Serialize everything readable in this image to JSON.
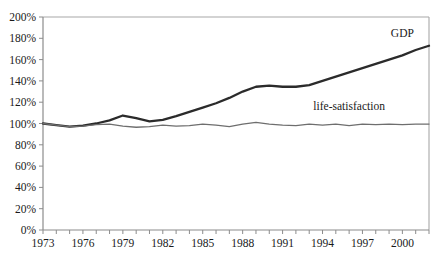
{
  "chart_data": {
    "type": "line",
    "title": "",
    "xlabel": "",
    "ylabel": "",
    "xlim": [
      1973,
      2002
    ],
    "ylim": [
      0,
      200
    ],
    "grid": false,
    "legend": "inline-labels",
    "y_tick_labels": [
      "0%",
      "20%",
      "40%",
      "60%",
      "80%",
      "100%",
      "120%",
      "140%",
      "160%",
      "180%",
      "200%"
    ],
    "y_tick_values": [
      0,
      20,
      40,
      60,
      80,
      100,
      120,
      140,
      160,
      180,
      200
    ],
    "x_tick_labels": [
      "1973",
      "1976",
      "1979",
      "1982",
      "1985",
      "1988",
      "1991",
      "1994",
      "1997",
      "2000"
    ],
    "x_tick_values": [
      1973,
      1976,
      1979,
      1982,
      1985,
      1988,
      1991,
      1994,
      1997,
      2000
    ],
    "x_minor_ticks": [
      1973,
      1974,
      1975,
      1976,
      1977,
      1978,
      1979,
      1980,
      1981,
      1982,
      1983,
      1984,
      1985,
      1986,
      1987,
      1988,
      1989,
      1990,
      1991,
      1992,
      1993,
      1994,
      1995,
      1996,
      1997,
      1998,
      1999,
      2000,
      2001,
      2002
    ],
    "x": [
      1973,
      1974,
      1975,
      1976,
      1977,
      1978,
      1979,
      1980,
      1981,
      1982,
      1983,
      1984,
      1985,
      1986,
      1987,
      1988,
      1989,
      1990,
      1991,
      1992,
      1993,
      1994,
      1995,
      1996,
      1997,
      1998,
      1999,
      2000,
      2001,
      2002
    ],
    "series": [
      {
        "name": "GDP",
        "color": "#2b2b2b",
        "width": 2.3,
        "label_x": 2000,
        "label_y": 181,
        "values": [
          100,
          98.5,
          97,
          98,
          100,
          103,
          107.5,
          105,
          102,
          103.5,
          107,
          111,
          115,
          119,
          124,
          130,
          134.5,
          135.5,
          134.5,
          134.5,
          136,
          140,
          144,
          148,
          152,
          156,
          160,
          164,
          169,
          173
        ]
      },
      {
        "name": "life-satisfaction",
        "color": "#6e6e6e",
        "width": 1.3,
        "label_x": 1996,
        "label_y": 113,
        "values": [
          100,
          98.5,
          97,
          97.5,
          99,
          99.5,
          97.5,
          96.5,
          97,
          98.5,
          97.5,
          98,
          99.5,
          98.5,
          97,
          99.5,
          101,
          99.5,
          98.5,
          98,
          99.5,
          98.5,
          99.5,
          98,
          99.5,
          99,
          99.5,
          99,
          99.5,
          99.5
        ]
      }
    ]
  },
  "layout": {
    "plot_left": 43,
    "plot_right": 429,
    "plot_top": 17,
    "plot_bottom": 230
  }
}
